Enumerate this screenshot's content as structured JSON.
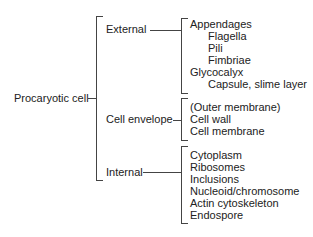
{
  "root": {
    "label": "Procaryotic cell"
  },
  "branches": [
    {
      "label": "External",
      "items": [
        {
          "text": "Appendages",
          "indent": 0
        },
        {
          "text": "Flagella",
          "indent": 1
        },
        {
          "text": "Pili",
          "indent": 1
        },
        {
          "text": "Fimbriae",
          "indent": 1
        },
        {
          "text": "Glycocalyx",
          "indent": 0
        },
        {
          "text": "Capsule, slime layer",
          "indent": 1
        }
      ]
    },
    {
      "label": "Cell envelope",
      "items": [
        {
          "text": "(Outer membrane)",
          "indent": 0
        },
        {
          "text": "Cell wall",
          "indent": 0
        },
        {
          "text": "Cell membrane",
          "indent": 0
        }
      ]
    },
    {
      "label": "Internal",
      "items": [
        {
          "text": "Cytoplasm",
          "indent": 0
        },
        {
          "text": "Ribosomes",
          "indent": 0
        },
        {
          "text": "Inclusions",
          "indent": 0
        },
        {
          "text": "Nucleoid/chromosome",
          "indent": 0
        },
        {
          "text": "Actin cytoskeleton",
          "indent": 0
        },
        {
          "text": "Endospore",
          "indent": 0
        }
      ]
    }
  ]
}
